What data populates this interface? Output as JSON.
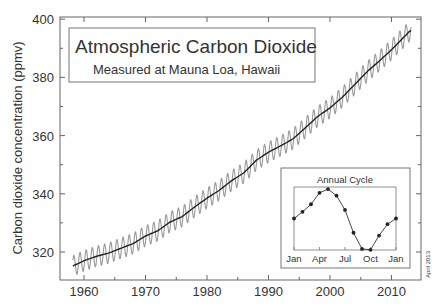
{
  "chart_data": {
    "type": "line",
    "title": "Atmospheric Carbon Dioxide",
    "subtitle": "Measured at Mauna Loa, Hawaii",
    "xlabel": "",
    "ylabel": "Carbon dioxide concentration (ppmv)",
    "xlim": [
      1956,
      2015
    ],
    "ylim": [
      312,
      401
    ],
    "x_ticks": [
      "1960",
      "1970",
      "1980",
      "1990",
      "2000",
      "2010"
    ],
    "y_ticks": [
      "320",
      "340",
      "360",
      "380",
      "400"
    ],
    "grid": false,
    "annotation": "April 2013",
    "series": [
      {
        "name": "Annual trend",
        "style": "dark line",
        "x": [
          1958,
          1960,
          1962,
          1964,
          1966,
          1968,
          1970,
          1972,
          1974,
          1976,
          1978,
          1980,
          1982,
          1984,
          1986,
          1988,
          1990,
          1992,
          1994,
          1996,
          1998,
          2000,
          2002,
          2004,
          2006,
          2008,
          2010,
          2012,
          2013
        ],
        "values": [
          315,
          317,
          318.5,
          319.6,
          321.3,
          322.9,
          325.5,
          327.3,
          330.3,
          332.2,
          335.5,
          338.5,
          341.2,
          344.5,
          347.2,
          351.5,
          354.3,
          356.5,
          358.9,
          362.7,
          366.6,
          369.5,
          373.2,
          377.5,
          381.9,
          385.6,
          389.5,
          393.8,
          396
        ]
      },
      {
        "name": "Monthly values",
        "style": "gray seasonal oscillation",
        "seasonal_amplitude_ppm": 3.5
      }
    ],
    "inset": {
      "title": "Annual Cycle",
      "type": "line",
      "x_ticks": [
        "Jan",
        "Apr",
        "Jul",
        "Oct",
        "Jan"
      ],
      "values": [
        0,
        0.7,
        1.5,
        2.7,
        3.1,
        2.4,
        0.9,
        -1.5,
        -3.2,
        -3.3,
        -1.8,
        -0.6,
        0
      ]
    }
  }
}
